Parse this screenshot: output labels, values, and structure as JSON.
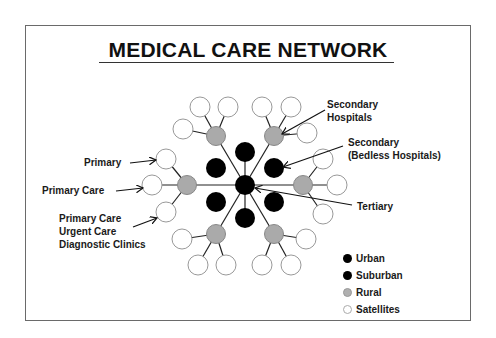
{
  "title": "MEDICAL CARE NETWORK",
  "labels": {
    "secondary_hospitals": [
      "Secondary",
      "Hospitals"
    ],
    "secondary_bedless": [
      "Secondary",
      "(Bedless Hospitals)"
    ],
    "tertiary": "Tertiary",
    "primary": "Primary",
    "primary_care": "Primary Care",
    "clinics": [
      "Primary Care",
      "Urgent Care",
      "Diagnostic Clinics"
    ]
  },
  "legend": [
    {
      "label": "Urban",
      "color": "#000000"
    },
    {
      "label": "Suburban",
      "color": "#000000"
    },
    {
      "label": "Rural",
      "color": "#b0b0b0"
    },
    {
      "label": "Satellites",
      "color": "#ffffff"
    }
  ],
  "colors": {
    "urban": "#000000",
    "rural": "#aaaaaa",
    "satellite": "#ffffff",
    "line": "#222222"
  }
}
